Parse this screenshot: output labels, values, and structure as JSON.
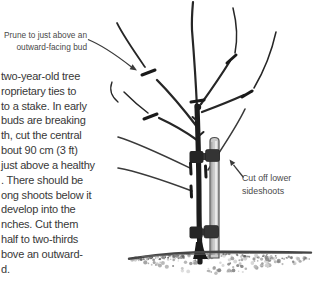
{
  "figure": {
    "callouts": {
      "prune": {
        "line1": "Prune to just above an",
        "line2": "outward-facing bud"
      },
      "cut": {
        "line1": "Cut off lower",
        "line2": "sideshoots"
      }
    },
    "body_text_lines": [
      "two-year-old tree",
      "roprietary ties to",
      "to a stake. In early",
      "buds are breaking",
      "th, cut the central",
      "bout 90 cm (3 ft)",
      "just above a healthy",
      ". There should be",
      "ong shoots below it",
      "develop into the",
      "nches. Cut them",
      "half to two-thirds",
      "bove an outward-",
      "d."
    ],
    "colors": {
      "branch": "#262626",
      "branch_tip": "#3a3a3a",
      "trunk": "#1c1c1c",
      "stake_fill": "#c9c9c9",
      "stake_edge": "#505050",
      "stake_highlight": "#e9e9e9",
      "tie_band": "#3a3a3a",
      "tie_block_left": "#252525",
      "tie_block_right": "#343434",
      "cut_mark": "#1a1a1a",
      "ground_edge": "#454545",
      "arrow": "#3a3a3a",
      "text": "#383838",
      "callout_text": "#4a4a4a"
    }
  }
}
